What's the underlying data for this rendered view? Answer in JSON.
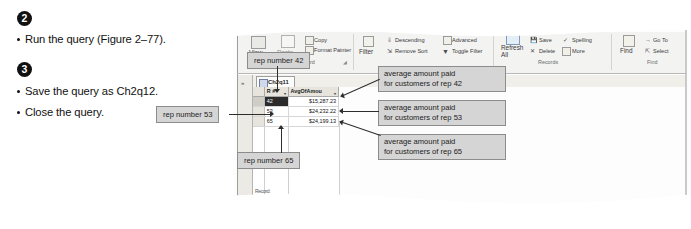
{
  "instructions": {
    "step2": {
      "number": "2",
      "bullets": [
        "Run the query (Figure 2–77)."
      ]
    },
    "step3": {
      "number": "3",
      "bullets": [
        "Save the query as Ch2q12.",
        "Close the query."
      ]
    }
  },
  "ribbon": {
    "groups": [
      {
        "name": "Clipboard",
        "label": "board",
        "items": [
          {
            "name": "view-button",
            "label": "View"
          },
          {
            "name": "paste-button",
            "label": "Paste"
          },
          {
            "name": "copy-button",
            "label": "Copy"
          },
          {
            "name": "format-painter-button",
            "label": "Format Painter"
          }
        ]
      },
      {
        "name": "Sort & Filter",
        "label": "",
        "items": [
          {
            "name": "filter-button",
            "label": "Filter"
          },
          {
            "name": "descending-button",
            "label": "Descending"
          },
          {
            "name": "advanced-button",
            "label": "Advanced "
          },
          {
            "name": "remove-sort-button",
            "label": "Remove Sort"
          },
          {
            "name": "toggle-filter-button",
            "label": "Toggle Filter"
          }
        ]
      },
      {
        "name": "Records",
        "label": "Records",
        "items": [
          {
            "name": "refresh-all-button",
            "label": "Refresh\nAll "
          },
          {
            "name": "save-record-button",
            "label": "Save"
          },
          {
            "name": "delete-button",
            "label": "Delete"
          },
          {
            "name": "spelling-button",
            "label": "Spelling"
          },
          {
            "name": "more-button",
            "label": "More "
          }
        ]
      },
      {
        "name": "Find",
        "label": "Find",
        "items": [
          {
            "name": "find-button",
            "label": "Find"
          },
          {
            "name": "go-to-button",
            "label": "Go To "
          },
          {
            "name": "select-button",
            "label": "Select "
          }
        ]
      }
    ]
  },
  "document": {
    "tab_label": "Ch2q11",
    "nav_pane_chevron": "»"
  },
  "datasheet": {
    "columns": [
      "R #",
      "AvgOfAmou"
    ],
    "rows": [
      {
        "rep": "42",
        "avg": "$15,287.23"
      },
      {
        "rep": "53",
        "avg": "$24,232.22"
      },
      {
        "rep": "65",
        "avg": "$24,199.13"
      }
    ],
    "record_nav": "Record:"
  },
  "callouts": {
    "rep42": "rep number 42",
    "rep53": "rep number 53",
    "rep65": "rep number 65",
    "avg42": "average amount paid\nfor customers of rep 42",
    "avg53": "average amount paid\nfor customers of rep 53",
    "avg65": "average amount paid\nfor customers of rep 65"
  },
  "colors": {
    "callout_fill": "#d5d5d5",
    "callout_border": "#8c8c8c",
    "leader": "#2d2d2d",
    "ribbon_bg": "#f3f3f2",
    "selection": "#2b2b2b"
  }
}
